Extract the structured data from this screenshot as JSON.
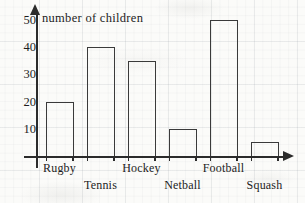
{
  "chart_data": {
    "type": "bar",
    "title": "number of children",
    "xlabel": "",
    "ylabel": "number of children",
    "categories": [
      "Rugby",
      "Tennis",
      "Hockey",
      "Netball",
      "Football",
      "Squash"
    ],
    "values": [
      20,
      40,
      35,
      10,
      50,
      5
    ],
    "ylim": [
      0,
      50
    ],
    "yticks": [
      10,
      20,
      30,
      40,
      50
    ],
    "ytick_labels": [
      "10",
      "20",
      "30",
      "40",
      "50"
    ],
    "grid": "faint graph-paper background",
    "legend": "none",
    "series": [
      {
        "name": "number of children",
        "values": [
          20,
          40,
          35,
          10,
          50,
          5
        ]
      }
    ],
    "label_rows": [
      "top",
      "bottom",
      "top",
      "bottom",
      "top",
      "bottom"
    ],
    "colors": {
      "bar_outline": "#3a3a3a",
      "bar_fill": "transparent",
      "axis": "#2b2b2b",
      "text": "#1d1d1d",
      "paper": "#fbfbf9"
    }
  }
}
